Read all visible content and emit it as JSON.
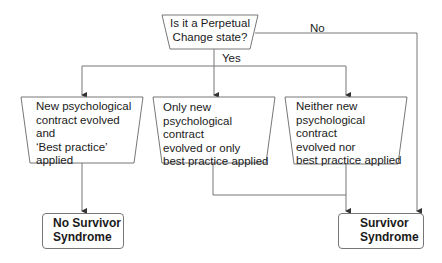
{
  "decision": {
    "text_line1": "Is it a Perpetual",
    "text_line2": "Change state?",
    "yes_label": "Yes",
    "no_label": "No"
  },
  "process_boxes": [
    {
      "lines": [
        "New psychological",
        "contract evolved",
        "and",
        "‘Best practice’",
        "applied"
      ]
    },
    {
      "lines": [
        "Only new",
        "psychological contract",
        "evolved or only",
        "best practice applied"
      ]
    },
    {
      "lines": [
        "Neither new",
        "psychological contract",
        "evolved nor",
        "best practice applied"
      ]
    }
  ],
  "outcomes": {
    "no_survivor": {
      "line1": "No Survivor",
      "line2": "Syndrome"
    },
    "survivor": {
      "line1": "Survivor",
      "line2": "Syndrome"
    }
  },
  "colors": {
    "line": "#777777",
    "text": "#1a1a1a",
    "background": "#ffffff"
  }
}
